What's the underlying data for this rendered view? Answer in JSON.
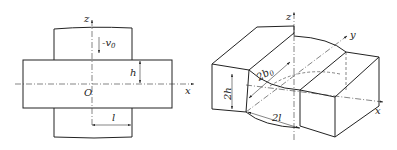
{
  "figure": {
    "left_view": {
      "title": "plan view of plate compression",
      "labels": {
        "z_axis": "z",
        "x_axis": "x",
        "origin": "O",
        "velocity": "-v",
        "velocity_sub": "0",
        "half_thickness": "h",
        "half_length": "l"
      }
    },
    "right_view": {
      "title": "isometric view of compression region",
      "labels": {
        "z_axis": "z",
        "x_axis": "x",
        "y_axis": "y",
        "thickness": "2h",
        "width": "2b",
        "width_sub": "0",
        "length": "2l"
      }
    },
    "colors": {
      "line": "#222222",
      "background": "#ffffff"
    }
  }
}
